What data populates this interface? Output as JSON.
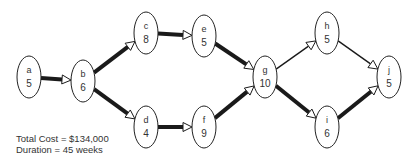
{
  "diagram": {
    "type": "network-activity-graph",
    "nodes": [
      {
        "id": "a",
        "label": "a",
        "duration": "5",
        "cx": 29,
        "cy": 77
      },
      {
        "id": "b",
        "label": "b",
        "duration": "6",
        "cx": 83,
        "cy": 81
      },
      {
        "id": "c",
        "label": "c",
        "duration": "8",
        "cx": 146,
        "cy": 33
      },
      {
        "id": "d",
        "label": "d",
        "duration": "4",
        "cx": 146,
        "cy": 127
      },
      {
        "id": "e",
        "label": "e",
        "duration": "5",
        "cx": 204,
        "cy": 36
      },
      {
        "id": "f",
        "label": "f",
        "duration": "9",
        "cx": 204,
        "cy": 127
      },
      {
        "id": "g",
        "label": "g",
        "duration": "10",
        "cx": 265,
        "cy": 77
      },
      {
        "id": "h",
        "label": "h",
        "duration": "5",
        "cx": 327,
        "cy": 33
      },
      {
        "id": "i",
        "label": "i",
        "duration": "6",
        "cx": 327,
        "cy": 127
      },
      {
        "id": "j",
        "label": "j",
        "duration": "5",
        "cx": 389,
        "cy": 77
      }
    ],
    "edges": [
      {
        "from": "a",
        "to": "b",
        "critical": true
      },
      {
        "from": "b",
        "to": "c",
        "critical": true
      },
      {
        "from": "b",
        "to": "d",
        "critical": true
      },
      {
        "from": "c",
        "to": "e",
        "critical": true
      },
      {
        "from": "d",
        "to": "f",
        "critical": true
      },
      {
        "from": "e",
        "to": "g",
        "critical": true
      },
      {
        "from": "f",
        "to": "g",
        "critical": true
      },
      {
        "from": "g",
        "to": "h",
        "critical": false
      },
      {
        "from": "g",
        "to": "i",
        "critical": true
      },
      {
        "from": "h",
        "to": "j",
        "critical": false
      },
      {
        "from": "i",
        "to": "j",
        "critical": true
      }
    ]
  },
  "summary": {
    "total_cost": "Total Cost = $134,000",
    "duration": "Duration = 45 weeks"
  }
}
